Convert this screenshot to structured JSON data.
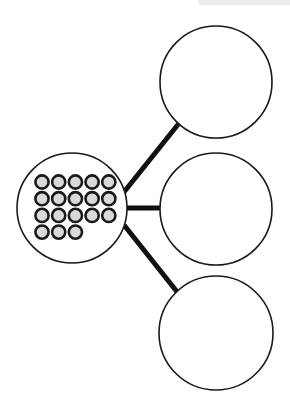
{
  "diagram": {
    "type": "part-whole number bond",
    "whole": {
      "counters": 18,
      "counter_rows": [
        5,
        5,
        5,
        3
      ],
      "counter_fill": "#d9d9d9",
      "counter_stroke": "#1a1a1a"
    },
    "parts": [
      {
        "label": "",
        "value": ""
      },
      {
        "label": "",
        "value": ""
      },
      {
        "label": "",
        "value": ""
      }
    ],
    "stroke_color": "#1a1a1a",
    "background": "#ffffff"
  }
}
